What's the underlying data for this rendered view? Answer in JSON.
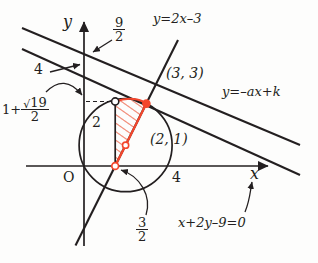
{
  "figure": {
    "axes": {
      "x_label": "x",
      "y_label": "y",
      "origin_label": "O"
    },
    "labels": {
      "y_intercept_upper": {
        "numerator": "9",
        "denominator": "2"
      },
      "y_intercept_lower": "4",
      "x_intercept_right": "4",
      "tangent_point_y": {
        "whole": "1+",
        "sqrt_radicand": "19",
        "denominator": "2"
      },
      "chord_left_x": {
        "numerator": "3",
        "denominator": "2"
      },
      "circle_y_label": "2",
      "point_center": "(2, 1)",
      "point_upper": "(3, 3)",
      "line_steep": "y=2x–3",
      "line_family": "y=–ax+k",
      "line_given": "x+2y–9=0"
    },
    "colors": {
      "ink": "#231f20",
      "accent": "#f4462c",
      "hatch": "#f07a63",
      "page": "#fdfdfc"
    },
    "geometry": {
      "origin_px": {
        "x": 84,
        "y": 166
      },
      "unit_px": 20.8,
      "circle_center_units": {
        "x": 2,
        "y": 1
      },
      "circle_radius_units": 2.236,
      "points": [
        {
          "name": "tangent-point",
          "x": 1.5,
          "y": 3.1,
          "style": "open"
        },
        {
          "name": "center-point",
          "x": 2,
          "y": 1,
          "style": "open"
        },
        {
          "name": "chord-foot-point",
          "x": 1.5,
          "y": 0,
          "style": "open-accent"
        },
        {
          "name": "intersection-point",
          "x": 3,
          "y": 3,
          "style": "filled-accent"
        }
      ]
    }
  }
}
